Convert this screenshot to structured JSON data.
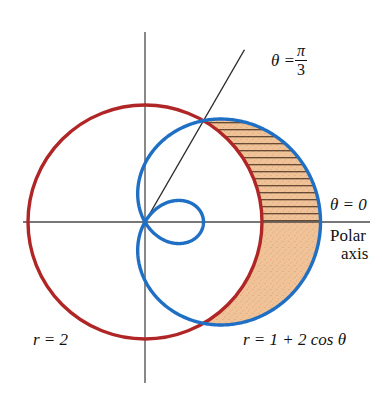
{
  "figure": {
    "background_color": "#ffffff"
  },
  "labels": {
    "ray_theta": "θ =",
    "ray_numerator": "π",
    "ray_denominator": "3",
    "polar_axis_theta": "θ = 0",
    "polar_axis_line1": "Polar",
    "polar_axis_line2": "axis",
    "circle_equation": "r = 2",
    "limacon_equation": "r = 1 + 2 cos θ"
  },
  "colors": {
    "circle_red": "#b02626",
    "limacon_blue": "#1f6fc4",
    "shade_orange": "#f0c398",
    "shade_orange_edge": "#e8b184",
    "hatch_line": "#3a2313",
    "axis": "#4a4a4a",
    "ray": "#2b2b2b",
    "text": "#111111"
  },
  "chart_data": {
    "type": "line",
    "coordinate_system": "polar",
    "xlabel": "Polar axis (θ = 0)",
    "ylabel": "",
    "pole_pixel": [
      145,
      222
    ],
    "unit_length_px": 58.5,
    "xlim": [
      -2.2,
      3.2
    ],
    "ylim": [
      -2.2,
      2.2
    ],
    "grid": false,
    "legend": "none",
    "series": [
      {
        "name": "r = 2",
        "equation": "r = 2",
        "color": "#b02626",
        "type": "circle",
        "radius": 2,
        "center": [
          0,
          0
        ],
        "theta_range_deg": [
          0,
          360
        ],
        "points_polar": [
          {
            "theta_deg": 0,
            "r": 2
          },
          {
            "theta_deg": 60,
            "r": 2
          },
          {
            "theta_deg": 120,
            "r": 2
          },
          {
            "theta_deg": 180,
            "r": 2
          },
          {
            "theta_deg": 240,
            "r": 2
          },
          {
            "theta_deg": 300,
            "r": 2
          }
        ]
      },
      {
        "name": "r = 1 + 2 cos θ",
        "equation": "r = 1 + 2 cos θ",
        "color": "#1f6fc4",
        "type": "limacon_with_inner_loop",
        "a": 1,
        "b": 2,
        "theta_range_deg": [
          0,
          360
        ],
        "max_r": 3,
        "inner_loop_theta_deg": [
          120,
          240
        ],
        "pole_crossing_theta_deg": [
          120,
          240
        ],
        "points_polar": [
          {
            "theta_deg": 0,
            "r": 3
          },
          {
            "theta_deg": 30,
            "r": 2.732
          },
          {
            "theta_deg": 60,
            "r": 2
          },
          {
            "theta_deg": 90,
            "r": 1
          },
          {
            "theta_deg": 120,
            "r": 0
          },
          {
            "theta_deg": 150,
            "r": -0.732
          },
          {
            "theta_deg": 180,
            "r": -1
          },
          {
            "theta_deg": 210,
            "r": -0.732
          },
          {
            "theta_deg": 240,
            "r": 0
          },
          {
            "theta_deg": 270,
            "r": 1
          },
          {
            "theta_deg": 300,
            "r": 2
          },
          {
            "theta_deg": 330,
            "r": 2.732
          },
          {
            "theta_deg": 360,
            "r": 3
          }
        ]
      },
      {
        "name": "θ = π/3 ray",
        "equation": "θ = π/3",
        "color": "#2b2b2b",
        "type": "ray",
        "angle_deg": 60,
        "from_pole": [
          0,
          0
        ],
        "to_r": 3.4
      }
    ],
    "intersections": [
      {
        "theta_deg": 60,
        "r": 2,
        "label": "circle meets limacon"
      },
      {
        "theta_deg": 300,
        "r": 2,
        "label": "circle meets limacon"
      }
    ],
    "shaded_regions": [
      {
        "name": "hatched-region",
        "fill": "#f0c398",
        "hatch": "horizontal",
        "hatch_color": "#3a2313",
        "theta_range_deg": [
          0,
          60
        ],
        "between": [
          "r = 2",
          "r = 1 + 2 cos θ"
        ],
        "description": "Region between circle r=2 and limacon from theta=0 to theta=pi/3, hatched"
      },
      {
        "name": "solid-region",
        "fill": "#f0c398",
        "hatch": "none",
        "theta_range_deg": [
          -60,
          0
        ],
        "between": [
          "r = 2",
          "r = 1 + 2 cos θ"
        ],
        "description": "Region between circle r=2 and limacon from theta=-pi/3 to theta=0, solid fill"
      }
    ],
    "axes": {
      "horizontal_axis_pixel": {
        "x1": 23,
        "x2": 370,
        "y": 222
      },
      "vertical_axis_pixel": {
        "x": 145,
        "y1": 32,
        "y2": 383
      }
    }
  }
}
